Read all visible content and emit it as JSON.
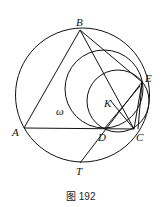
{
  "figure": {
    "caption": "图 192",
    "points": {
      "A": {
        "label": "A",
        "x": 24,
        "y": 128
      },
      "B": {
        "label": "B",
        "x": 80,
        "y": 30
      },
      "C": {
        "label": "C",
        "x": 134,
        "y": 129
      },
      "D": {
        "label": "D",
        "x": 104,
        "y": 129
      },
      "E": {
        "label": "E",
        "x": 142,
        "y": 82
      },
      "K": {
        "label": "K",
        "x": 110,
        "y": 100
      },
      "T": {
        "label": "T",
        "x": 80,
        "y": 163
      }
    },
    "circle_label": "ω",
    "circles": [
      {
        "name": "circumcircle",
        "cx": 82.5,
        "cy": 95,
        "r": 67
      },
      {
        "name": "omega",
        "cx": 104,
        "cy": 89,
        "r": 39
      },
      {
        "name": "small-circle",
        "cx": 118,
        "cy": 101,
        "r": 31
      }
    ]
  }
}
